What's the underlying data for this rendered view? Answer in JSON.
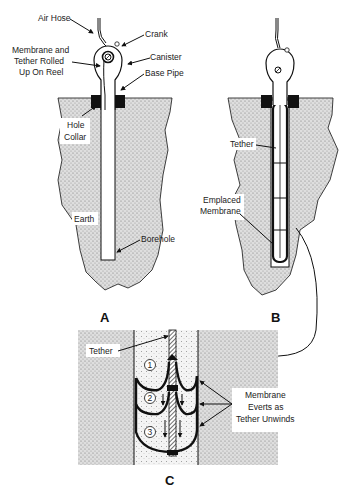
{
  "diagram": {
    "panels": [
      {
        "id": "A",
        "label": "A",
        "labels": {
          "air_hose": "Air Hose",
          "crank": "Crank",
          "canister": "Canister",
          "membrane_line1": "Membrane and",
          "membrane_line2": "Tether Rolled",
          "membrane_line3": "Up On Reel",
          "base_pipe": "Base Pipe",
          "hole_collar_line1": "Hole",
          "hole_collar_line2": "Collar",
          "earth": "Earth",
          "borehole": "Borehole"
        }
      },
      {
        "id": "B",
        "label": "B",
        "labels": {
          "tether": "Tether",
          "emplaced_line1": "Emplaced",
          "emplaced_line2": "Membrane"
        }
      },
      {
        "id": "C",
        "label": "C",
        "labels": {
          "tether": "Tether",
          "stage_1": "1",
          "stage_2": "2",
          "stage_3": "3",
          "everts_line1": "Membrane",
          "everts_line2": "Everts as",
          "everts_line3": "Tether Unwinds"
        }
      }
    ],
    "colors": {
      "line": "#111111",
      "earth_fill": "#cfcfcf",
      "background": "#ffffff"
    }
  }
}
